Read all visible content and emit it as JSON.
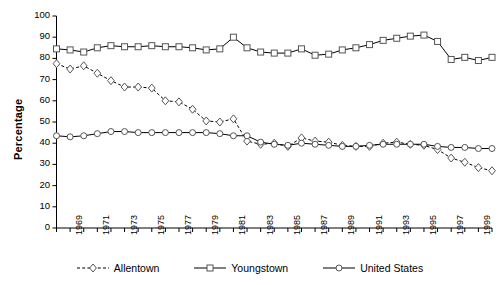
{
  "chart_data": {
    "type": "line",
    "title": "",
    "xlabel": "",
    "ylabel": "Percentage",
    "ylim": [
      0,
      100
    ],
    "ytick_step": 10,
    "yticks": [
      0,
      10,
      20,
      30,
      40,
      50,
      60,
      70,
      80,
      90,
      100
    ],
    "grid": false,
    "legend_position": "bottom",
    "x": [
      1968,
      1969,
      1970,
      1971,
      1972,
      1973,
      1974,
      1975,
      1976,
      1977,
      1978,
      1979,
      1980,
      1981,
      1982,
      1983,
      1984,
      1985,
      1986,
      1987,
      1988,
      1989,
      1990,
      1991,
      1992,
      1993,
      1994,
      1995,
      1996,
      1997,
      1998,
      1999,
      2000
    ],
    "xtick_labels": [
      "1969",
      "1971",
      "1973",
      "1975",
      "1977",
      "1979",
      "1981",
      "1983",
      "1985",
      "1987",
      "1989",
      "1991",
      "1993",
      "1995",
      "1997",
      "1999"
    ],
    "xtick_values": [
      1969,
      1971,
      1973,
      1975,
      1977,
      1979,
      1981,
      1983,
      1985,
      1987,
      1989,
      1991,
      1993,
      1995,
      1997,
      1999
    ],
    "series": [
      {
        "name": "Allentown",
        "marker": "diamond",
        "line_style": "dashed",
        "color": "#000000",
        "values": [
          77.5,
          75.0,
          76.5,
          73.0,
          69.5,
          66.5,
          66.5,
          66.0,
          60.0,
          59.5,
          56.0,
          50.5,
          50.0,
          51.5,
          41.0,
          39.5,
          40.0,
          38.5,
          42.5,
          41.0,
          40.5,
          39.0,
          38.5,
          38.5,
          40.0,
          40.5,
          39.5,
          39.0,
          37.0,
          33.0,
          31.0,
          28.5,
          27.0
        ]
      },
      {
        "name": "Youngstown",
        "marker": "square",
        "line_style": "solid",
        "color": "#000000",
        "values": [
          84.5,
          84.0,
          83.0,
          85.0,
          86.0,
          85.5,
          85.5,
          86.0,
          85.5,
          85.5,
          85.0,
          84.0,
          84.5,
          90.0,
          85.0,
          83.0,
          82.5,
          82.5,
          84.5,
          81.5,
          82.0,
          84.0,
          85.0,
          86.5,
          88.5,
          89.5,
          90.5,
          91.0,
          88.0,
          79.5,
          80.5,
          79.0,
          80.5
        ]
      },
      {
        "name": "United States",
        "marker": "circle",
        "line_style": "solid",
        "color": "#000000",
        "values": [
          43.5,
          43.0,
          43.5,
          44.5,
          45.5,
          45.5,
          45.0,
          45.0,
          45.0,
          45.0,
          45.0,
          45.0,
          44.5,
          43.5,
          43.5,
          40.5,
          39.5,
          39.0,
          40.0,
          39.5,
          39.0,
          38.5,
          38.5,
          39.0,
          39.5,
          39.5,
          39.5,
          39.5,
          38.5,
          38.0,
          38.0,
          37.5,
          37.5
        ]
      }
    ]
  }
}
